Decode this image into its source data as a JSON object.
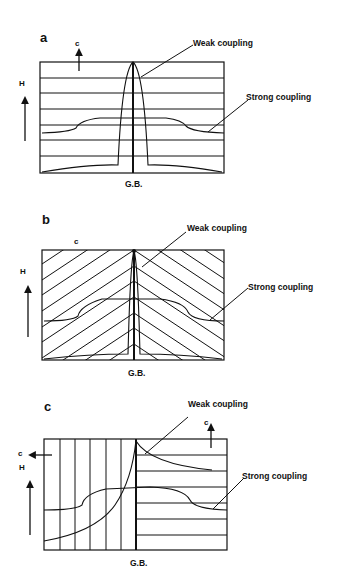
{
  "panels": [
    {
      "id": "a",
      "label": "a",
      "c_axis_label": "c",
      "field_label": "H",
      "weak_label": "Weak coupling",
      "strong_label": "Strong coupling",
      "boundary_label": "G.B."
    },
    {
      "id": "b",
      "label": "b",
      "c_axis_label": "c",
      "field_label": "H",
      "weak_label": "Weak coupling",
      "strong_label": "Strong coupling",
      "boundary_label": "G.B."
    },
    {
      "id": "c",
      "label": "c",
      "c_axis_label_left": "c",
      "c_axis_label_right": "c",
      "field_label": "H",
      "weak_label": "Weak coupling",
      "strong_label": "Strong coupling",
      "boundary_label": "G.B."
    }
  ],
  "colors": {
    "ink": "#111111",
    "background": "#ffffff"
  }
}
